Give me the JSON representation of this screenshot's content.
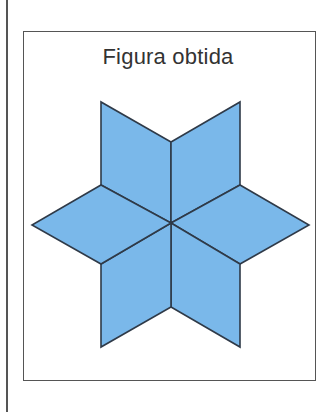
{
  "figure": {
    "title": "Figura obtida",
    "shape": "six-pointed star made of 6 rhombi",
    "fill_color": "#7ab8ea",
    "stroke_color": "#2f3a48",
    "rhombus_count": 6
  }
}
